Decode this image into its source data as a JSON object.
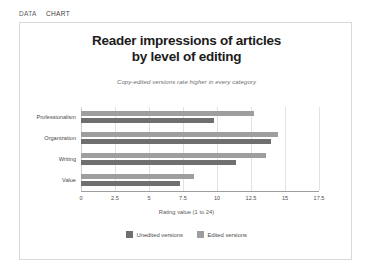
{
  "tabs": [
    {
      "label": "DATA",
      "name": "tab-data",
      "selected": false
    },
    {
      "label": "CHART",
      "name": "tab-chart",
      "selected": true
    }
  ],
  "chart_data": {
    "type": "bar",
    "orientation": "horizontal",
    "title": "Reader impressions of articles by level of editing",
    "title_line1": "Reader impressions of articles",
    "title_line2": "by level of editing",
    "subtitle": "Copy-edited versions rate higher in every category",
    "xlabel": "Rating value (1 to 24)",
    "ylabel": "",
    "categories": [
      "Professionalism",
      "Organization",
      "Writing",
      "Value"
    ],
    "series": [
      {
        "name": "Unedited versions",
        "color": "#6f6f6f",
        "values": [
          9.8,
          14.0,
          11.4,
          7.3
        ]
      },
      {
        "name": "Edited versions",
        "color": "#9e9e9e",
        "values": [
          12.7,
          14.5,
          13.6,
          8.3
        ]
      }
    ],
    "xlim": [
      0,
      17.5
    ],
    "xticks": [
      "0",
      "2.5",
      "5",
      "7.5",
      "10",
      "12.5",
      "15",
      "17.5"
    ],
    "xtick_values": [
      0,
      2.5,
      5,
      7.5,
      10,
      12.5,
      15,
      17.5
    ],
    "grid": true,
    "grid_axis": "x",
    "legend_position": "bottom"
  }
}
